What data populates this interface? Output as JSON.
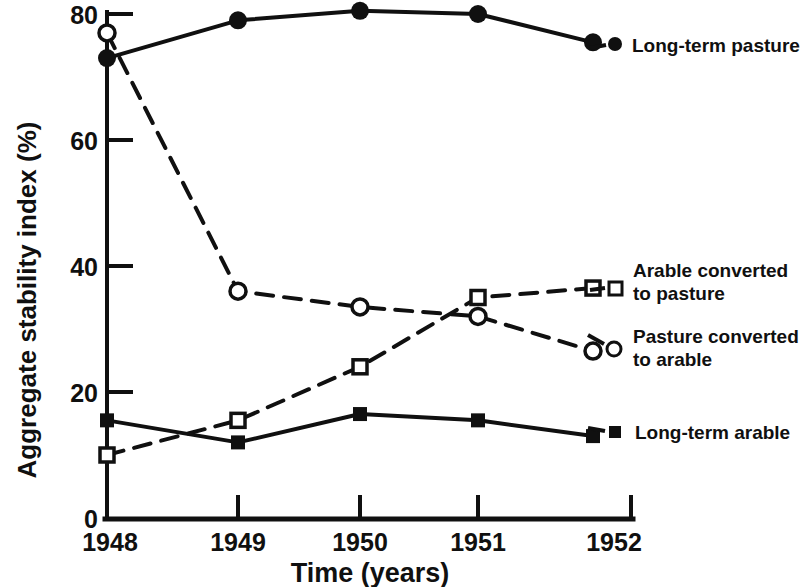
{
  "chart_data": {
    "type": "line",
    "title": "",
    "subtitle": "",
    "xlabel": "Time (years)",
    "ylabel": "Aggregate stability index (%)",
    "x": [
      1948,
      1949,
      1950,
      1951,
      1952
    ],
    "xtick_labels": [
      "1948",
      "1949",
      "1950",
      "1951",
      "1952"
    ],
    "ytick_labels": [
      "0",
      "20",
      "40",
      "60",
      "80"
    ],
    "ytick_values": [
      0,
      20,
      40,
      60,
      80
    ],
    "xlim": [
      1948,
      1952
    ],
    "ylim": [
      0,
      80
    ],
    "grid": false,
    "legend_position": "right-inline",
    "series": [
      {
        "name": "Long-term pasture",
        "marker": "filled-circle",
        "line": "solid",
        "color": "#101010",
        "values": [
          73,
          79,
          80.5,
          80,
          75.5
        ]
      },
      {
        "name": "Pasture converted to arable",
        "marker": "open-circle",
        "line": "dashed",
        "color": "#101010",
        "values": [
          77,
          36,
          33.5,
          32,
          26.5
        ]
      },
      {
        "name": "Arable converted to pasture",
        "marker": "open-square",
        "line": "dashed",
        "color": "#101010",
        "values": [
          10,
          15.5,
          24,
          35,
          36.5
        ]
      },
      {
        "name": "Long-term arable",
        "marker": "filled-square",
        "line": "solid",
        "color": "#101010",
        "values": [
          15.5,
          12,
          16.5,
          15.5,
          13
        ]
      }
    ]
  },
  "axes": {
    "y_title": "Aggregate stability index (%)",
    "x_title": "Time (years)",
    "y_ticks": [
      "80",
      "60",
      "40",
      "20",
      "0"
    ],
    "x_ticks": [
      "1948",
      "1949",
      "1950",
      "1951",
      "1952"
    ]
  },
  "legend": {
    "entries": [
      {
        "label_line1": "Long-term pasture",
        "label_line2": "",
        "marker": "filled-circle-icon"
      },
      {
        "label_line1": "Arable converted",
        "label_line2": "to pasture",
        "marker": "open-square-icon"
      },
      {
        "label_line1": "Pasture converted",
        "label_line2": "to arable",
        "marker": "open-circle-icon"
      },
      {
        "label_line1": "Long-term arable",
        "label_line2": "",
        "marker": "filled-square-icon"
      }
    ]
  },
  "colors": {
    "ink": "#101010",
    "background": "#ffffff"
  }
}
